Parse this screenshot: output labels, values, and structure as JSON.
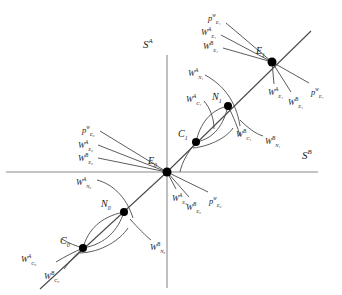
{
  "figure": {
    "type": "phase-portrait-diagram",
    "background": "#ffffff",
    "stroke_color": "#3a3a3a",
    "node_color": "#000000",
    "width": 342,
    "height": 295
  },
  "axes": {
    "vertical": {
      "label_base": "S",
      "label_sup": "A",
      "x": 167,
      "top": 55,
      "bottom": 288
    },
    "horizontal": {
      "label_base": "S",
      "label_sup": "B",
      "y": 172,
      "left": 6,
      "right": 318
    },
    "origin": {
      "x": 167,
      "y": 172
    }
  },
  "points": [
    {
      "id": "C0",
      "base": "C",
      "sub": "0",
      "x": 83,
      "y": 248,
      "label_x": 60,
      "label_y": 236
    },
    {
      "id": "N0",
      "base": "N",
      "sub": "0",
      "x": 124,
      "y": 212,
      "label_x": 101,
      "label_y": 199
    },
    {
      "id": "E0",
      "base": "E",
      "sub": "0",
      "x": 167,
      "y": 172,
      "label_x": 148,
      "label_y": 156
    },
    {
      "id": "C1",
      "base": "C",
      "sub": "1",
      "x": 196,
      "y": 142,
      "label_x": 178,
      "label_y": 129
    },
    {
      "id": "N1",
      "base": "N",
      "sub": "1",
      "x": 228,
      "y": 106,
      "label_x": 212,
      "label_y": 92
    },
    {
      "id": "E1",
      "base": "E",
      "sub": "1",
      "x": 272,
      "y": 62,
      "label_x": 256,
      "label_y": 46
    }
  ],
  "manifold_labels": [
    {
      "id": "pw-E1-upper",
      "base": "p",
      "sup": "w",
      "sub": "E₁",
      "x": 208,
      "y": 14
    },
    {
      "id": "WA-E1-upper",
      "base": "W",
      "sup": "A",
      "sub": "E₁",
      "x": 201,
      "y": 28
    },
    {
      "id": "WB-E1-upper",
      "base": "W",
      "sup": "B",
      "sub": "E₁",
      "x": 203,
      "y": 42
    },
    {
      "id": "WA-E1-lower",
      "base": "W",
      "sup": "A",
      "sub": "E₁",
      "x": 268,
      "y": 88
    },
    {
      "id": "WB-E1-lower",
      "base": "W",
      "sup": "B",
      "sub": "E₁",
      "x": 288,
      "y": 98
    },
    {
      "id": "pw-E1-lower",
      "base": "p",
      "sup": "w",
      "sub": "E₁",
      "x": 311,
      "y": 88
    },
    {
      "id": "WA-N1",
      "base": "W",
      "sup": "A",
      "sub": "N₁",
      "x": 188,
      "y": 69
    },
    {
      "id": "WA-C1",
      "base": "W",
      "sup": "A",
      "sub": "C₁",
      "x": 186,
      "y": 95
    },
    {
      "id": "WB-C1",
      "base": "W",
      "sup": "B",
      "sub": "C₁",
      "x": 236,
      "y": 130
    },
    {
      "id": "WB-N1",
      "base": "W",
      "sup": "B",
      "sub": "N₁",
      "x": 265,
      "y": 137
    },
    {
      "id": "pw-E0-upper",
      "base": "p",
      "sup": "w",
      "sub": "E₀",
      "x": 82,
      "y": 126
    },
    {
      "id": "WA-E0-upper",
      "base": "W",
      "sup": "A",
      "sub": "E₀",
      "x": 78,
      "y": 141
    },
    {
      "id": "WB-E0-upper",
      "base": "W",
      "sup": "B",
      "sub": "E₀",
      "x": 78,
      "y": 154
    },
    {
      "id": "WA-E0-lower",
      "base": "W",
      "sup": "A",
      "sub": "E₀",
      "x": 172,
      "y": 194
    },
    {
      "id": "WB-E0-lower",
      "base": "W",
      "sup": "B",
      "sub": "E₀",
      "x": 186,
      "y": 203
    },
    {
      "id": "pw-E0-lower",
      "base": "p",
      "sup": "w",
      "sub": "E₀",
      "x": 209,
      "y": 197
    },
    {
      "id": "WA-N0",
      "base": "W",
      "sup": "A",
      "sub": "N₀",
      "x": 76,
      "y": 178
    },
    {
      "id": "WB-N0",
      "base": "W",
      "sup": "B",
      "sub": "N₀",
      "x": 150,
      "y": 243
    },
    {
      "id": "WA-C0",
      "base": "W",
      "sup": "A",
      "sub": "C₀",
      "x": 21,
      "y": 255
    },
    {
      "id": "WB-C0",
      "base": "W",
      "sup": "B",
      "sub": "C₀",
      "x": 44,
      "y": 272
    }
  ]
}
